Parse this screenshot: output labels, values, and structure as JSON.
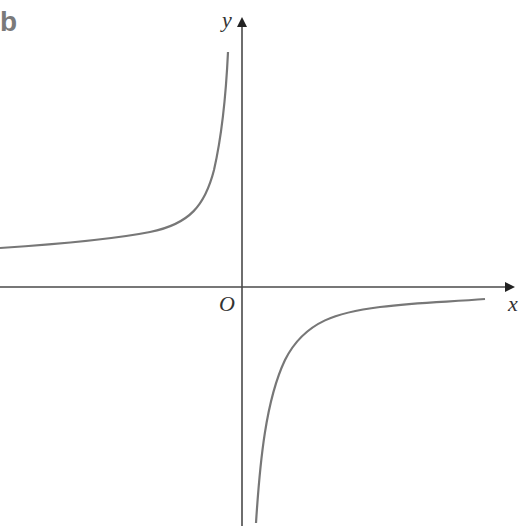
{
  "figure": {
    "label": "b",
    "axes": {
      "x_label": "x",
      "y_label": "y",
      "origin_label": "O"
    },
    "colors": {
      "axis": "#4a4a4a",
      "curve": "#777777",
      "label": "#7a7a7a"
    }
  }
}
